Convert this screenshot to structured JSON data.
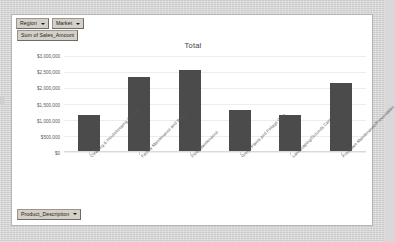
{
  "panel": {
    "page_filters": [
      {
        "label": "Region",
        "icon": "chevron-down-icon"
      },
      {
        "label": "Market",
        "icon": "chevron-down-icon"
      }
    ],
    "data_field": {
      "label": "Sum of Sales_Amount"
    },
    "row_field": {
      "label": "Product_Description",
      "icon": "chevron-down-icon"
    }
  },
  "chart_data": {
    "type": "bar",
    "title": "Total",
    "xlabel": "",
    "ylabel": "",
    "grid": true,
    "legend": false,
    "ylim": [
      0,
      3000000
    ],
    "ytick_labels": [
      "$3,000,000",
      "$2,500,000",
      "$2,000,000",
      "$1,500,000",
      "$1,000,000",
      "$500,000",
      "$0"
    ],
    "ytick_values": [
      3000000,
      2500000,
      2000000,
      1500000,
      1000000,
      500000,
      0
    ],
    "categories": [
      "Cleaning & Housekeeping Services",
      "Facility Maintenance and Repair",
      "Fleet Maintenance",
      "Green Plants and Foliage Care",
      "Landscaping/Grounds Care",
      "Predictive Maintenance/Preventative"
    ],
    "values": [
      1150000,
      2350000,
      2560000,
      1300000,
      1150000,
      2150000
    ],
    "series": [
      {
        "name": "Total",
        "color": "#4b4b4b",
        "values": [
          1150000,
          2350000,
          2560000,
          1300000,
          1150000,
          2150000
        ]
      }
    ]
  }
}
